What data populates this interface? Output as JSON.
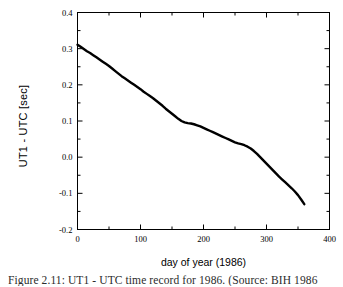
{
  "figure": {
    "caption": "Figure 2.11:  UT1 - UTC time record for 1986. (Source: BIH 1986",
    "background_color": "#ffffff"
  },
  "chart_data": {
    "type": "line",
    "title": "",
    "xlabel": "day of year (1986)",
    "ylabel": "UT1 - UTC [sec]",
    "xlim": [
      0,
      400
    ],
    "ylim": [
      -0.2,
      0.4
    ],
    "grid": false,
    "legend": null,
    "line_color": "#000000",
    "line_width": 2.4,
    "x_major_ticks": [
      0,
      100,
      200,
      300,
      400
    ],
    "x_major_tick_labels": [
      "0",
      "100",
      "200",
      "300",
      "400"
    ],
    "x_minor_ticks": [
      50,
      150,
      250,
      350
    ],
    "y_major_ticks": [
      -0.2,
      -0.1,
      0.0,
      0.1,
      0.2,
      0.3,
      0.4
    ],
    "y_major_tick_labels": [
      "-0.2",
      "-0.1",
      "0.0",
      "0.1",
      "0.2",
      "0.3",
      "0.4"
    ],
    "y_minor_ticks": [
      -0.15,
      -0.05,
      0.05,
      0.15,
      0.25,
      0.35
    ],
    "series": [
      {
        "name": "UT1 - UTC",
        "x": [
          0,
          5,
          10,
          15,
          20,
          25,
          30,
          35,
          40,
          45,
          50,
          55,
          60,
          65,
          70,
          75,
          80,
          85,
          90,
          95,
          100,
          105,
          110,
          115,
          120,
          125,
          130,
          135,
          140,
          145,
          150,
          155,
          160,
          165,
          170,
          175,
          180,
          185,
          190,
          195,
          200,
          205,
          210,
          215,
          220,
          225,
          230,
          235,
          240,
          245,
          250,
          255,
          260,
          265,
          270,
          275,
          280,
          285,
          290,
          295,
          300,
          305,
          310,
          315,
          320,
          325,
          330,
          335,
          340,
          345,
          350,
          355,
          360
        ],
        "y": [
          0.311,
          0.305,
          0.299,
          0.293,
          0.288,
          0.282,
          0.276,
          0.27,
          0.264,
          0.258,
          0.252,
          0.245,
          0.238,
          0.231,
          0.224,
          0.218,
          0.212,
          0.206,
          0.2,
          0.194,
          0.188,
          0.181,
          0.175,
          0.169,
          0.163,
          0.156,
          0.149,
          0.142,
          0.134,
          0.127,
          0.12,
          0.113,
          0.106,
          0.1,
          0.096,
          0.094,
          0.093,
          0.091,
          0.088,
          0.085,
          0.081,
          0.077,
          0.073,
          0.069,
          0.065,
          0.061,
          0.057,
          0.053,
          0.049,
          0.045,
          0.041,
          0.038,
          0.036,
          0.033,
          0.029,
          0.024,
          0.017,
          0.009,
          0.0,
          -0.009,
          -0.018,
          -0.027,
          -0.036,
          -0.045,
          -0.054,
          -0.062,
          -0.07,
          -0.078,
          -0.086,
          -0.095,
          -0.105,
          -0.117,
          -0.13
        ]
      }
    ]
  }
}
